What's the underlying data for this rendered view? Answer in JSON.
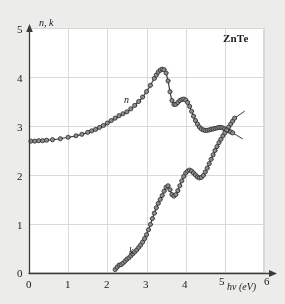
{
  "figure": {
    "material_label": "ZnTe",
    "background_color": "#ececeb",
    "plot_background_color": "#ffffff",
    "grid_color": "#d9d9d9",
    "axis_color": "#3a3a3a",
    "marker_fill": "#8f8f8f",
    "marker_edge": "#2b2b2b",
    "curve_color": "#3c3c3c"
  },
  "axes": {
    "y_title": "n, k",
    "x_title": "hv (eV)",
    "x_ticks": [
      "0",
      "1",
      "2",
      "3",
      "4",
      "5",
      "6"
    ],
    "y_ticks": [
      "0",
      "1",
      "2",
      "3",
      "4",
      "5"
    ]
  },
  "series_labels": {
    "n": "n",
    "k": "k"
  },
  "chart_data": {
    "type": "line",
    "title": "ZnTe",
    "xlabel": "hv (eV)",
    "ylabel": "n, k",
    "xlim": [
      0,
      6
    ],
    "ylim": [
      0,
      5
    ],
    "xticks": [
      0,
      1,
      2,
      3,
      4,
      5,
      6
    ],
    "yticks": [
      0,
      1,
      2,
      3,
      4,
      5
    ],
    "grid": true,
    "legend": "inline-annotations",
    "annotations": [
      {
        "text": "ZnTe",
        "x": 5.15,
        "y": 4.65
      },
      {
        "text": "n",
        "x": 2.55,
        "y": 3.45
      },
      {
        "text": "k",
        "x": 2.7,
        "y": 0.62
      }
    ],
    "series": [
      {
        "name": "n",
        "marker": "circle",
        "x": [
          0.05,
          0.15,
          0.25,
          0.35,
          0.45,
          0.6,
          0.8,
          1.0,
          1.2,
          1.35,
          1.5,
          1.6,
          1.7,
          1.8,
          1.9,
          2.0,
          2.1,
          2.2,
          2.3,
          2.4,
          2.5,
          2.6,
          2.7,
          2.8,
          2.9,
          3.0,
          3.1,
          3.2,
          3.25,
          3.3,
          3.35,
          3.4,
          3.45,
          3.5,
          3.55,
          3.6,
          3.65,
          3.7,
          3.75,
          3.8,
          3.85,
          3.9,
          3.95,
          4.0,
          4.05,
          4.1,
          4.15,
          4.2,
          4.25,
          4.3,
          4.35,
          4.4,
          4.45,
          4.5,
          4.55,
          4.6,
          4.65,
          4.7,
          4.75,
          4.8,
          4.85,
          4.9,
          4.95,
          5.0,
          5.05,
          5.1,
          5.15,
          5.2
        ],
        "y": [
          2.69,
          2.69,
          2.7,
          2.7,
          2.71,
          2.72,
          2.74,
          2.77,
          2.8,
          2.83,
          2.87,
          2.9,
          2.93,
          2.97,
          3.01,
          3.06,
          3.11,
          3.16,
          3.21,
          3.25,
          3.29,
          3.35,
          3.42,
          3.5,
          3.59,
          3.7,
          3.83,
          3.97,
          4.04,
          4.1,
          4.14,
          4.16,
          4.15,
          4.08,
          3.92,
          3.7,
          3.52,
          3.44,
          3.44,
          3.48,
          3.52,
          3.54,
          3.55,
          3.53,
          3.48,
          3.4,
          3.3,
          3.2,
          3.11,
          3.04,
          2.98,
          2.94,
          2.92,
          2.91,
          2.91,
          2.92,
          2.93,
          2.94,
          2.95,
          2.96,
          2.97,
          2.97,
          2.96,
          2.94,
          2.92,
          2.9,
          2.88,
          2.86
        ],
        "tail": {
          "x": [
            5.2,
            5.45
          ],
          "y": [
            2.86,
            2.74
          ]
        }
      },
      {
        "name": "k",
        "marker": "circle",
        "x": [
          2.2,
          2.25,
          2.3,
          2.35,
          2.4,
          2.45,
          2.5,
          2.55,
          2.6,
          2.65,
          2.7,
          2.75,
          2.8,
          2.85,
          2.9,
          2.95,
          3.0,
          3.05,
          3.1,
          3.15,
          3.2,
          3.25,
          3.3,
          3.35,
          3.4,
          3.45,
          3.5,
          3.55,
          3.6,
          3.65,
          3.7,
          3.75,
          3.8,
          3.85,
          3.9,
          3.95,
          4.0,
          4.05,
          4.1,
          4.15,
          4.2,
          4.25,
          4.3,
          4.35,
          4.4,
          4.45,
          4.5,
          4.55,
          4.6,
          4.65,
          4.7,
          4.75,
          4.8,
          4.85,
          4.9,
          4.95,
          5.0,
          5.05,
          5.1,
          5.15,
          5.2,
          5.25
        ],
        "y": [
          0.07,
          0.12,
          0.16,
          0.17,
          0.2,
          0.24,
          0.28,
          0.31,
          0.35,
          0.39,
          0.43,
          0.47,
          0.52,
          0.57,
          0.63,
          0.7,
          0.78,
          0.88,
          0.99,
          1.11,
          1.22,
          1.33,
          1.42,
          1.5,
          1.58,
          1.67,
          1.75,
          1.78,
          1.7,
          1.6,
          1.57,
          1.6,
          1.68,
          1.78,
          1.88,
          1.97,
          2.04,
          2.08,
          2.1,
          2.08,
          2.04,
          2.0,
          1.96,
          1.94,
          1.95,
          1.99,
          2.06,
          2.14,
          2.23,
          2.32,
          2.41,
          2.5,
          2.58,
          2.66,
          2.73,
          2.8,
          2.86,
          2.92,
          2.98,
          3.04,
          3.1,
          3.16
        ],
        "tail": {
          "x": [
            5.25,
            5.5
          ],
          "y": [
            3.16,
            3.3
          ]
        }
      }
    ]
  }
}
